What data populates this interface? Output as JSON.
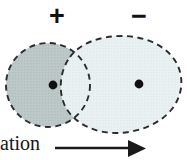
{
  "figure": {
    "background_color": "#ffffff"
  },
  "labels": {
    "positive": "+",
    "negative": "−"
  },
  "axis": {
    "caption": "ation",
    "arrow_direction": "right",
    "arrow_color": "#1a1a1a"
  },
  "shapes": {
    "positive_cloud": {
      "name": "positive-charge-cloud",
      "fill": "#b9c6c6",
      "stroke": "#2b2b2b",
      "dash": "6 4",
      "center_x": 48,
      "center_y": 85,
      "radius": 42
    },
    "negative_cloud": {
      "name": "negative-charge-cloud",
      "fill": "#e7f0f1",
      "stroke": "#2b2b2b",
      "dash": "6 4",
      "center_x": 118,
      "center_y": 84,
      "radius_x": 62,
      "radius_y": 47
    }
  },
  "nuclei": [
    {
      "name": "positive-nucleus-dot",
      "cx": 53,
      "cy": 85,
      "r": 4.4,
      "color": "#111111"
    },
    {
      "name": "negative-nucleus-dot",
      "cx": 139,
      "cy": 84,
      "r": 4.4,
      "color": "#111111"
    }
  ],
  "colors": {
    "dark_cloud": "#b9c6c6",
    "light_cloud": "#e7f0f1",
    "outline": "#2b2b2b",
    "ink": "#111111"
  }
}
